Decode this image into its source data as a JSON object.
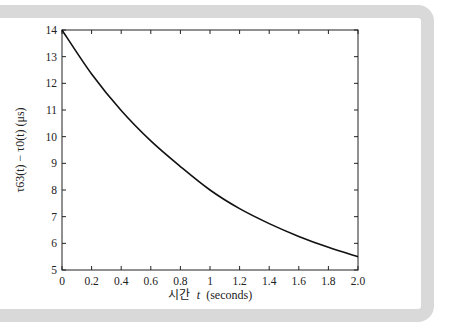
{
  "chart_data": {
    "type": "line",
    "title": "",
    "xlabel": "시간  t (seconds)",
    "ylabel": "τ_63(t) − τ_0(t) (μs)",
    "xlim": [
      0,
      2.0
    ],
    "ylim": [
      5,
      14
    ],
    "x_ticks": [
      "0",
      "0.2",
      "0.4",
      "0.6",
      "0.8",
      "1",
      "1.2",
      "1.4",
      "1.6",
      "1.8",
      "2.0"
    ],
    "y_ticks": [
      "5",
      "6",
      "7",
      "8",
      "9",
      "10",
      "11",
      "12",
      "13",
      "14"
    ],
    "grid": false,
    "legend": null,
    "series": [
      {
        "name": "delay difference",
        "color": "#111111",
        "x": [
          0,
          0.2,
          0.4,
          0.6,
          0.8,
          1.0,
          1.2,
          1.4,
          1.6,
          1.8,
          2.0
        ],
        "y": [
          14.0,
          12.35,
          10.98,
          9.84,
          8.88,
          8.0,
          7.3,
          6.74,
          6.26,
          5.85,
          5.5
        ]
      }
    ]
  },
  "labels": {
    "xlabel_korean": "시간",
    "xlabel_var": "t",
    "xlabel_unit": "(seconds)",
    "ylabel_text": "τ63(t) − τ0(t) (μs)"
  }
}
